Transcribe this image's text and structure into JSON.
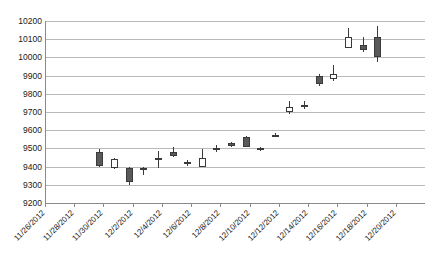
{
  "chart_data": {
    "type": "candlestick",
    "title": "",
    "xlabel": "",
    "ylabel": "",
    "ylim": [
      9200,
      10200
    ],
    "ytick_step": 100,
    "yticks": [
      10200,
      10100,
      10000,
      9900,
      9800,
      9700,
      9600,
      9500,
      9400,
      9300,
      9200
    ],
    "grid": true,
    "legend": "none",
    "xtick_labels": [
      "11/26/2012",
      "11/28/2012",
      "11/30/2012",
      "12/2/2012",
      "12/4/2012",
      "12/6/2012",
      "12/8/2012",
      "12/10/2012",
      "12/12/2012",
      "12/14/2012",
      "12/16/2012",
      "12/18/2012",
      "12/20/2012"
    ],
    "xtick_step_days": 2,
    "colors": {
      "up_fill": "#ffffff",
      "down_fill": "#595959",
      "outline": "#3a3a3a",
      "grid": "#b9b9b9",
      "axis": "#8a8a8a"
    },
    "candles": [
      {
        "date": "11/26/2012",
        "open": 9480,
        "high": 9495,
        "low": 9395,
        "close": 9405,
        "dir": "down"
      },
      {
        "date": "11/27/2012",
        "open": 9440,
        "high": 9450,
        "low": 9385,
        "close": 9395,
        "dir": "up"
      },
      {
        "date": "11/28/2012",
        "open": 9390,
        "high": 9400,
        "low": 9300,
        "close": 9315,
        "dir": "down"
      },
      {
        "date": "11/29/2012",
        "open": 9385,
        "high": 9400,
        "low": 9355,
        "close": 9395,
        "dir": "up"
      },
      {
        "date": "11/30/2012",
        "open": 9440,
        "high": 9485,
        "low": 9395,
        "close": 9445,
        "dir": "up"
      },
      {
        "date": "12/3/2012",
        "open": 9480,
        "high": 9510,
        "low": 9450,
        "close": 9460,
        "dir": "down"
      },
      {
        "date": "12/4/2012",
        "open": 9420,
        "high": 9435,
        "low": 9405,
        "close": 9425,
        "dir": "up"
      },
      {
        "date": "12/5/2012",
        "open": 9450,
        "high": 9495,
        "low": 9400,
        "close": 9400,
        "dir": "up"
      },
      {
        "date": "12/6/2012",
        "open": 9495,
        "high": 9520,
        "low": 9480,
        "close": 9500,
        "dir": "up"
      },
      {
        "date": "12/7/2012",
        "open": 9530,
        "high": 9535,
        "low": 9510,
        "close": 9515,
        "dir": "down"
      },
      {
        "date": "12/10/2012",
        "open": 9560,
        "high": 9570,
        "low": 9505,
        "close": 9510,
        "dir": "down"
      },
      {
        "date": "12/11/2012",
        "open": 9500,
        "high": 9510,
        "low": 9485,
        "close": 9490,
        "dir": "up"
      },
      {
        "date": "12/12/2012",
        "open": 9575,
        "high": 9585,
        "low": 9560,
        "close": 9575,
        "dir": "down"
      },
      {
        "date": "12/13/2012",
        "open": 9730,
        "high": 9760,
        "low": 9690,
        "close": 9700,
        "dir": "up"
      },
      {
        "date": "12/14/2012",
        "open": 9740,
        "high": 9760,
        "low": 9715,
        "close": 9730,
        "dir": "up"
      },
      {
        "date": "12/18/2012",
        "open": 9900,
        "high": 9910,
        "low": 9845,
        "close": 9855,
        "dir": "down"
      },
      {
        "date": "12/19/2012",
        "open": 9880,
        "high": 9960,
        "low": 9870,
        "close": 9910,
        "dir": "up"
      },
      {
        "date": "12/20/2012",
        "open": 10110,
        "high": 10160,
        "low": 10065,
        "close": 10050,
        "dir": "up"
      },
      {
        "date": "12/21/2012",
        "open": 10070,
        "high": 10110,
        "low": 10030,
        "close": 10040,
        "dir": "down"
      },
      {
        "date": "12/24/2012",
        "open": 10110,
        "high": 10170,
        "low": 9975,
        "close": 10000,
        "dir": "down"
      }
    ]
  }
}
